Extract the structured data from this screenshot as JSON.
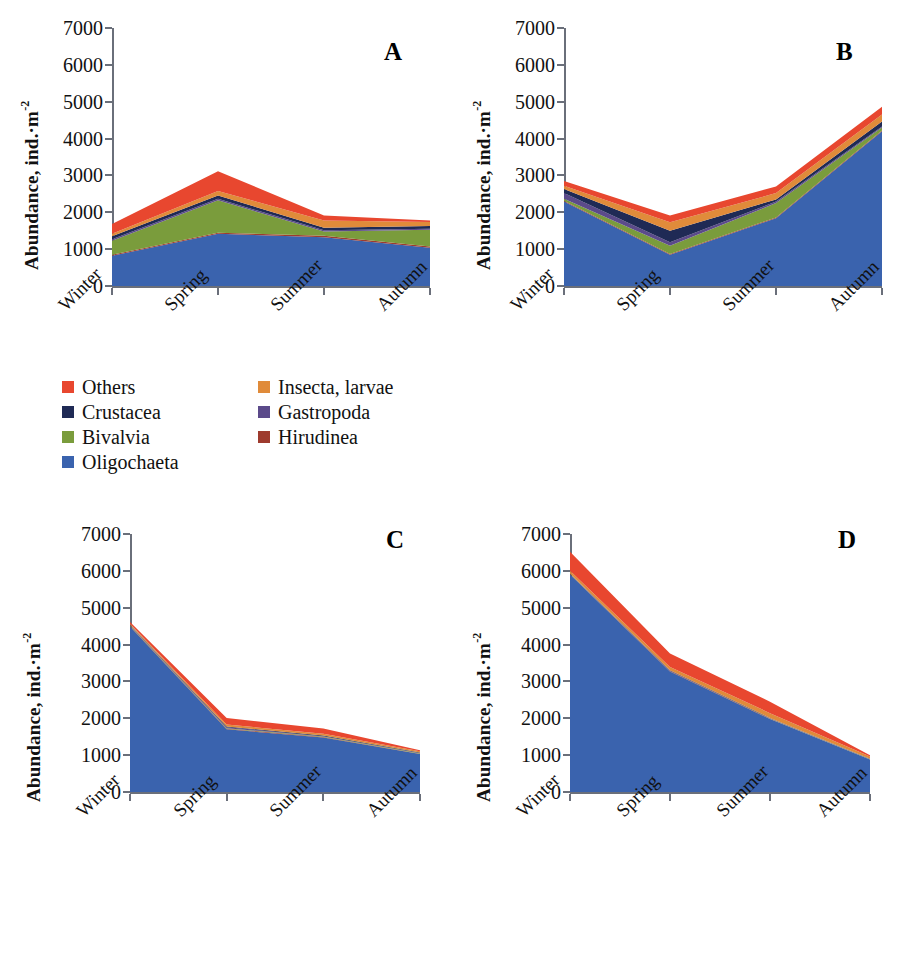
{
  "figure": {
    "axis_color": "#6a6f7a",
    "panels": [
      "A",
      "B",
      "C",
      "D"
    ]
  },
  "legend": {
    "rows": [
      [
        {
          "label": "Others",
          "color": "#e8472f"
        },
        {
          "label": "Insecta, larvae",
          "color": "#e08b3a"
        }
      ],
      [
        {
          "label": "Crustacea",
          "color": "#1f2a55"
        },
        {
          "label": "Gastropoda",
          "color": "#5b4a8a"
        }
      ],
      [
        {
          "label": "Bivalvia",
          "color": "#7a9c3c"
        },
        {
          "label": "Hirudinea",
          "color": "#9e3b2e"
        }
      ],
      [
        {
          "label": "Oligochaeta",
          "color": "#3a63ae"
        }
      ]
    ]
  },
  "chart_data": [
    {
      "type": "area",
      "panel": "A",
      "title": "A",
      "xlabel": "",
      "ylabel": "Abundance, ind.·m⁻²",
      "categories": [
        "Winter",
        "Spring",
        "Summer",
        "Autumn"
      ],
      "ylim": [
        0,
        7000
      ],
      "yticks": [
        0,
        1000,
        2000,
        3000,
        4000,
        5000,
        6000,
        7000
      ],
      "grid": false,
      "legend_position": "below-left",
      "stacked": true,
      "series": [
        {
          "name": "Oligochaeta",
          "color": "#3a63ae",
          "values": [
            820,
            1420,
            1320,
            1040
          ]
        },
        {
          "name": "Hirudinea",
          "color": "#9e3b2e",
          "values": [
            30,
            25,
            40,
            35
          ]
        },
        {
          "name": "Bivalvia",
          "color": "#7a9c3c",
          "values": [
            380,
            880,
            120,
            450
          ]
        },
        {
          "name": "Gastropoda",
          "color": "#5b4a8a",
          "values": [
            40,
            40,
            30,
            30
          ]
        },
        {
          "name": "Crustacea",
          "color": "#1f2a55",
          "values": [
            80,
            90,
            70,
            70
          ]
        },
        {
          "name": "Insecta, larvae",
          "color": "#e08b3a",
          "values": [
            70,
            120,
            200,
            110
          ]
        },
        {
          "name": "Others",
          "color": "#e8472f",
          "values": [
            260,
            540,
            130,
            45
          ]
        }
      ],
      "totals": [
        1680,
        3115,
        1910,
        1780
      ]
    },
    {
      "type": "area",
      "panel": "B",
      "title": "B",
      "xlabel": "",
      "ylabel": "Abundance, ind.·m⁻²",
      "categories": [
        "Winter",
        "Spring",
        "Summer",
        "Autumn"
      ],
      "ylim": [
        0,
        7000
      ],
      "yticks": [
        0,
        1000,
        2000,
        3000,
        4000,
        5000,
        6000,
        7000
      ],
      "grid": false,
      "stacked": true,
      "series": [
        {
          "name": "Oligochaeta",
          "color": "#3a63ae",
          "values": [
            2290,
            850,
            1840,
            4200
          ]
        },
        {
          "name": "Hirudinea",
          "color": "#9e3b2e",
          "values": [
            20,
            20,
            20,
            20
          ]
        },
        {
          "name": "Bivalvia",
          "color": "#7a9c3c",
          "values": [
            60,
            220,
            390,
            80
          ]
        },
        {
          "name": "Gastropoda",
          "color": "#5b4a8a",
          "values": [
            150,
            100,
            40,
            30
          ]
        },
        {
          "name": "Crustacea",
          "color": "#1f2a55",
          "values": [
            110,
            310,
            60,
            130
          ]
        },
        {
          "name": "Insecta, larvae",
          "color": "#e08b3a",
          "values": [
            90,
            230,
            170,
            190
          ]
        },
        {
          "name": "Others",
          "color": "#e8472f",
          "values": [
            130,
            180,
            180,
            210
          ]
        }
      ],
      "totals": [
        2850,
        1910,
        2700,
        4860
      ]
    },
    {
      "type": "area",
      "panel": "C",
      "title": "C",
      "xlabel": "",
      "ylabel": "Abundance, ind.·m⁻²",
      "categories": [
        "Winter",
        "Spring",
        "Summer",
        "Autumn"
      ],
      "ylim": [
        0,
        7000
      ],
      "yticks": [
        0,
        1000,
        2000,
        3000,
        4000,
        5000,
        6000,
        7000
      ],
      "grid": false,
      "stacked": true,
      "series": [
        {
          "name": "Oligochaeta",
          "color": "#3a63ae",
          "values": [
            4490,
            1700,
            1480,
            1030
          ]
        },
        {
          "name": "Hirudinea",
          "color": "#9e3b2e",
          "values": [
            15,
            15,
            15,
            10
          ]
        },
        {
          "name": "Bivalvia",
          "color": "#7a9c3c",
          "values": [
            10,
            15,
            10,
            10
          ]
        },
        {
          "name": "Gastropoda",
          "color": "#5b4a8a",
          "values": [
            10,
            30,
            10,
            10
          ]
        },
        {
          "name": "Crustacea",
          "color": "#1f2a55",
          "values": [
            15,
            20,
            15,
            10
          ]
        },
        {
          "name": "Insecta, larvae",
          "color": "#e08b3a",
          "values": [
            25,
            50,
            50,
            35
          ]
        },
        {
          "name": "Others",
          "color": "#e8472f",
          "values": [
            45,
            180,
            140,
            25
          ]
        }
      ],
      "totals": [
        4610,
        2010,
        1720,
        1130
      ]
    },
    {
      "type": "area",
      "panel": "D",
      "title": "D",
      "xlabel": "",
      "ylabel": "Abundance, ind.·m⁻²",
      "categories": [
        "Winter",
        "Spring",
        "Summer",
        "Autumn"
      ],
      "ylim": [
        0,
        7000
      ],
      "yticks": [
        0,
        1000,
        2000,
        3000,
        4000,
        5000,
        6000,
        7000
      ],
      "grid": false,
      "stacked": true,
      "series": [
        {
          "name": "Oligochaeta",
          "color": "#3a63ae",
          "values": [
            5900,
            3270,
            1980,
            880
          ]
        },
        {
          "name": "Hirudinea",
          "color": "#9e3b2e",
          "values": [
            10,
            10,
            10,
            5
          ]
        },
        {
          "name": "Bivalvia",
          "color": "#7a9c3c",
          "values": [
            5,
            5,
            5,
            5
          ]
        },
        {
          "name": "Gastropoda",
          "color": "#5b4a8a",
          "values": [
            5,
            5,
            5,
            5
          ]
        },
        {
          "name": "Crustacea",
          "color": "#1f2a55",
          "values": [
            10,
            10,
            10,
            5
          ]
        },
        {
          "name": "Insecta, larvae",
          "color": "#e08b3a",
          "values": [
            70,
            90,
            130,
            60
          ]
        },
        {
          "name": "Others",
          "color": "#e8472f",
          "values": [
            520,
            370,
            310,
            40
          ]
        }
      ],
      "totals": [
        6520,
        3760,
        2450,
        1000
      ]
    }
  ]
}
